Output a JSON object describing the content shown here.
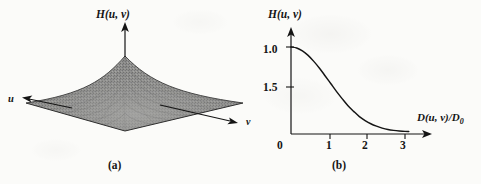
{
  "figure": {
    "background_color": "#fbfbf9",
    "ink_color": "#141414",
    "surface_fill_color": "#8c8c8c",
    "surface_edge_color": "#3a3a3a"
  },
  "panel_a": {
    "caption": "(a)",
    "vertical_axis_label": "H(u, v)",
    "left_axis_label": "u",
    "right_axis_label": "v",
    "description": "3D perspective mesh plot of a Gaussian lowpass filter transfer function"
  },
  "panel_b": {
    "caption": "(b)",
    "y_axis_label": "H(u, v)",
    "x_axis_label_main": "D(u, v)/D",
    "x_axis_label_subscript": "0",
    "y_tick_labels": [
      "1.0",
      "1.5"
    ],
    "x_tick_labels": [
      "0",
      "1",
      "2",
      "3"
    ]
  },
  "chart_data": {
    "type": "line",
    "title": "",
    "subtitle": "",
    "xlabel": "D(u, v)/D0",
    "ylabel": "H(u, v)",
    "xlim": [
      0,
      3.3
    ],
    "ylim": [
      0,
      1.12
    ],
    "grid": false,
    "legend": null,
    "x_ticks": [
      0,
      1,
      2,
      3
    ],
    "x_tick_labels": [
      "0",
      "1",
      "2",
      "3"
    ],
    "y_ticks": [
      1.0,
      0.5
    ],
    "y_tick_labels": [
      "1.0",
      "1.5"
    ],
    "series": [
      {
        "name": "H(u, v)",
        "x": [
          0,
          0.15,
          0.3,
          0.45,
          0.6,
          0.75,
          0.9,
          1.05,
          1.2,
          1.35,
          1.5,
          1.65,
          1.8,
          1.95,
          2.1,
          2.25,
          2.4,
          2.55,
          2.7,
          2.85,
          3.0,
          3.1
        ],
        "y": [
          1.0,
          0.989,
          0.956,
          0.904,
          0.835,
          0.756,
          0.667,
          0.577,
          0.487,
          0.404,
          0.325,
          0.26,
          0.2,
          0.155,
          0.118,
          0.09,
          0.068,
          0.052,
          0.042,
          0.035,
          0.03,
          0.029
        ]
      }
    ],
    "annotations": [
      {
        "text": "(a)",
        "role": "panel-caption"
      },
      {
        "text": "(b)",
        "role": "panel-caption"
      }
    ]
  },
  "panel_a_surface": {
    "type": "surface",
    "description": "Gaussian peak over a diamond-shaped (rotated square) ground plane",
    "peak_height_px": 58,
    "plane_half_width_px": 118,
    "plane_half_depth_px": 33
  }
}
